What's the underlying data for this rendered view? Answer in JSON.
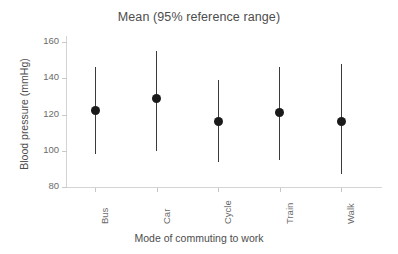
{
  "chart_data": {
    "type": "scatter",
    "title": "Mean (95% reference range)",
    "xlabel": "Mode of commuting to work",
    "ylabel": "Blood pressure (mmHg)",
    "categories": [
      "Bus",
      "Car",
      "Cycle",
      "Train",
      "Walk"
    ],
    "values": [
      122,
      129,
      116,
      121,
      116
    ],
    "lower": [
      98,
      100,
      94,
      95,
      87
    ],
    "upper": [
      146,
      155,
      139,
      146,
      148
    ],
    "yticks": [
      80,
      100,
      120,
      140,
      160
    ],
    "ylim": [
      78,
      161
    ],
    "grid": false,
    "legend": "none",
    "marker_color": "#1a1a1a",
    "errorbar_color": "#3a3a3a",
    "axis_color": "#d4d4d4",
    "text_color": "#4d4d4d",
    "background": "#ffffff",
    "series": [
      {
        "name": "Mean (95% reference range)",
        "points": [
          {
            "category": "Bus",
            "mean": 122,
            "lower": 98,
            "upper": 146
          },
          {
            "category": "Car",
            "mean": 129,
            "lower": 100,
            "upper": 155
          },
          {
            "category": "Cycle",
            "mean": 116,
            "lower": 94,
            "upper": 139
          },
          {
            "category": "Train",
            "mean": 121,
            "lower": 95,
            "upper": 146
          },
          {
            "category": "Walk",
            "mean": 116,
            "lower": 87,
            "upper": 148
          }
        ]
      }
    ]
  }
}
